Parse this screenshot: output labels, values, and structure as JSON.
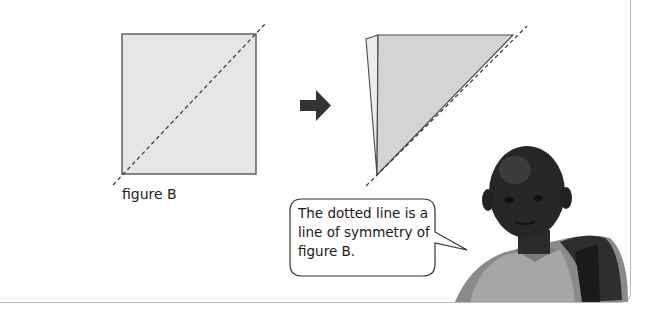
{
  "figure": {
    "caption": "figure B",
    "square_fill": "#e6e6e6",
    "triangle_fill": "#d4d4d4",
    "back_sheet_fill": "#ececec",
    "outline_color": "#4a4a4a"
  },
  "arrow": {
    "icon": "right-arrow-icon",
    "color": "#333333"
  },
  "speech_bubble": {
    "lines": [
      "The dotted line is a",
      "line of symmetry of",
      "figure B."
    ]
  },
  "photo": {
    "subject": "boy-with-backpack"
  }
}
